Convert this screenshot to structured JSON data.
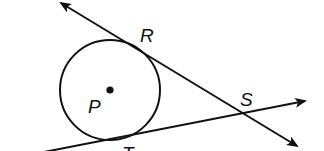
{
  "diagram": {
    "colors": {
      "stroke": "#111111",
      "background": "#ffffff"
    },
    "circle": {
      "center_label": "P",
      "cx": 110,
      "cy": 90,
      "r": 50
    },
    "points": {
      "P": {
        "label": "P",
        "x": 110,
        "y": 90
      },
      "R": {
        "label": "R",
        "x": 136,
        "y": 46
      },
      "S": {
        "label": "S",
        "x": 245,
        "y": 113
      },
      "T": {
        "label": "T",
        "x": 110,
        "y": 140
      }
    },
    "labels": {
      "R": "R",
      "S": "S",
      "P": "P",
      "T": "T"
    },
    "lines": [
      {
        "name": "line-RS",
        "through": [
          "R",
          "S"
        ],
        "arrows": "both"
      },
      {
        "name": "line-TS",
        "through": [
          "T",
          "S"
        ],
        "arrows": "both"
      }
    ]
  }
}
